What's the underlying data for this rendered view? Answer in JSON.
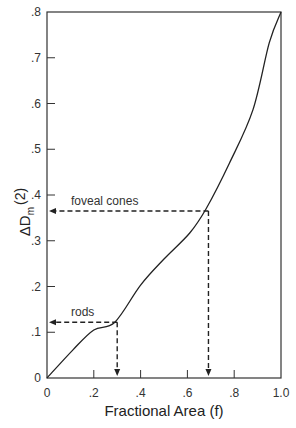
{
  "chart_data": {
    "type": "line",
    "title": "",
    "xlabel": "Fractional Area (f)",
    "ylabel": "ΔD_m(2)",
    "ylabel_main": "ΔD",
    "ylabel_sub": "m",
    "ylabel_suffix": "(2)",
    "xlim": [
      0,
      1.0
    ],
    "ylim": [
      0,
      0.8
    ],
    "grid": false,
    "x_ticks": [
      "0",
      ".2",
      ".4",
      ".6",
      ".8",
      "1.0"
    ],
    "y_ticks": [
      "0",
      ".1",
      ".2",
      ".3",
      ".4",
      ".5",
      ".6",
      ".7",
      ".8"
    ],
    "series": [
      {
        "name": "curve",
        "x": [
          0,
          0.11,
          0.2,
          0.29,
          0.4,
          0.5,
          0.61,
          0.68,
          0.78,
          0.88,
          0.95,
          1.0
        ],
        "y": [
          0,
          0.061,
          0.105,
          0.122,
          0.203,
          0.26,
          0.317,
          0.37,
          0.47,
          0.586,
          0.733,
          0.8
        ]
      }
    ],
    "annotations": [
      {
        "label": "rods",
        "f": 0.3,
        "delta_d": 0.122
      },
      {
        "label": "foveal cones",
        "f": 0.69,
        "delta_d": 0.365
      }
    ]
  }
}
